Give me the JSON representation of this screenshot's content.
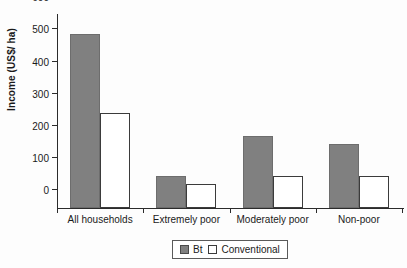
{
  "chart_data": {
    "type": "bar",
    "title": "",
    "xlabel": "",
    "ylabel": "Income (US$/ ha)",
    "ylim": [
      0,
      600
    ],
    "yticks": [
      0,
      100,
      200,
      300,
      400,
      500,
      600
    ],
    "ytick_labels": [
      "0",
      "100",
      "200",
      "300",
      "400",
      "500",
      "600"
    ],
    "grid": false,
    "legend_position": "bottom-center",
    "categories": [
      "All households",
      "Extremely poor",
      "Moderately poor",
      "Non-poor"
    ],
    "series": [
      {
        "name": "Bt",
        "color": "#808080",
        "values": [
          542,
          100,
          225,
          200
        ]
      },
      {
        "name": "Conventional",
        "color": "#ffffff",
        "values": [
          295,
          75,
          98,
          100
        ]
      }
    ]
  },
  "legend": {
    "entries": [
      {
        "label": "Bt",
        "swatch": "bt"
      },
      {
        "label": "Conventional",
        "swatch": "conventional"
      }
    ]
  }
}
